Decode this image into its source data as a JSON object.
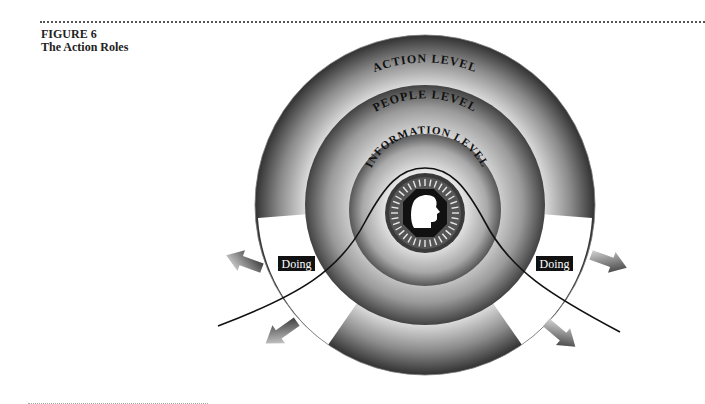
{
  "figure": {
    "number": "FIGURE 6",
    "title": "The Action Roles"
  },
  "diagram": {
    "rings": [
      {
        "name": "action-level",
        "label": "ACTION LEVEL"
      },
      {
        "name": "people-level",
        "label": "PEOPLE LEVEL"
      },
      {
        "name": "information-level",
        "label": "INFORMATION LEVEL"
      }
    ],
    "side_labels": {
      "left": "Doing",
      "right": "Doing"
    },
    "center_icon": "head-profile-icon",
    "arrows": [
      "arrow-upper-left",
      "arrow-lower-left",
      "arrow-upper-right",
      "arrow-lower-right"
    ]
  }
}
